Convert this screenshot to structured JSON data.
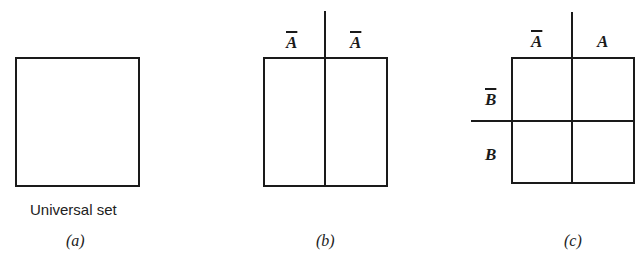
{
  "panels": {
    "a": {
      "caption_text": "Universal set",
      "caption_label": "(a)"
    },
    "b": {
      "top_labels": [
        "A",
        "A"
      ],
      "top_labels_complement": [
        true,
        true
      ],
      "caption_label": "(b)"
    },
    "c": {
      "top_labels": [
        "A",
        "A"
      ],
      "top_labels_complement": [
        true,
        false
      ],
      "side_labels": [
        "B",
        "B"
      ],
      "side_labels_complement": [
        true,
        false
      ],
      "caption_label": "(c)"
    }
  },
  "colors": {
    "line": "#1a1a1a",
    "background": "#ffffff"
  }
}
